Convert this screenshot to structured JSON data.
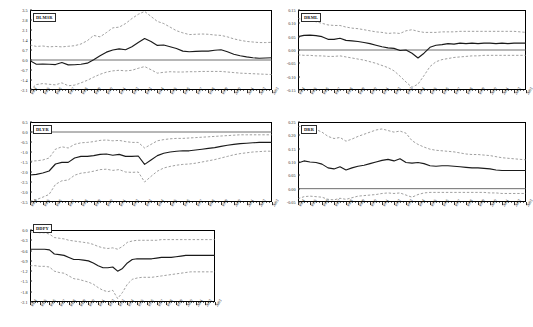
{
  "figure": {
    "type": "multi-panel-line-chart",
    "panel_count": 5
  },
  "axis": {
    "x_labels": [
      "1984",
      "1985",
      "1986",
      "1987",
      "1988",
      "1989",
      "1990",
      "1991",
      "1992",
      "1993",
      "1994",
      "1995",
      "1996",
      "1997",
      "1998",
      "1999",
      "2000",
      "2001",
      "2002",
      "2003"
    ],
    "x_min": 1984,
    "x_max": 2003
  },
  "colors": {
    "estimate": "#1a1a1a",
    "band": "#777777",
    "frame": "#000000",
    "zero": "#4a4a4a",
    "background": "#ffffff"
  },
  "chart_data": [
    {
      "id": "dlm3r",
      "type": "line",
      "title": "DLM3R",
      "xlabel": "",
      "ylabel": "",
      "grid": false,
      "legend": "none",
      "ylim": [
        -2.1,
        3.5
      ],
      "yticks": [
        "3.5",
        "2.8",
        "2.1",
        "1.4",
        "0.7",
        "0.0",
        "-0.7",
        "-1.4",
        "-2.1"
      ],
      "ytick_values": [
        3.5,
        2.8,
        2.1,
        1.4,
        0.7,
        0.0,
        -0.7,
        -1.4,
        -2.1
      ],
      "x": [
        1984,
        1984.5,
        1985,
        1985.5,
        1986,
        1986.5,
        1987,
        1987.5,
        1988,
        1988.5,
        1989,
        1989.5,
        1990,
        1990.5,
        1991,
        1991.5,
        1992,
        1992.5,
        1993,
        1993.5,
        1994,
        1994.5,
        1995,
        1995.5,
        1996,
        1996.5,
        1997,
        1997.5,
        1998,
        1998.5,
        1999,
        1999.5,
        2000,
        2000.5,
        2001,
        2001.5,
        2002,
        2002.5,
        2003
      ],
      "series": [
        {
          "name": "estimate",
          "style": "solid",
          "values": [
            -0.05,
            -0.3,
            -0.28,
            -0.3,
            -0.32,
            -0.18,
            -0.34,
            -0.33,
            -0.3,
            -0.22,
            0.02,
            0.3,
            0.55,
            0.7,
            0.78,
            0.72,
            0.93,
            1.22,
            1.5,
            1.3,
            1.02,
            1.05,
            0.93,
            0.8,
            0.62,
            0.58,
            0.6,
            0.62,
            0.62,
            0.68,
            0.72,
            0.58,
            0.4,
            0.3,
            0.22,
            0.16,
            0.12,
            0.14,
            0.16
          ]
        },
        {
          "name": "upper_band",
          "style": "dashed",
          "values": [
            1.05,
            0.95,
            0.98,
            0.92,
            0.95,
            0.92,
            0.96,
            1.0,
            1.12,
            1.35,
            1.72,
            1.62,
            1.92,
            2.25,
            2.3,
            2.55,
            2.9,
            3.2,
            3.4,
            3.05,
            2.7,
            2.55,
            2.3,
            2.05,
            1.9,
            1.78,
            1.8,
            1.82,
            1.8,
            1.75,
            1.72,
            1.62,
            1.48,
            1.38,
            1.3,
            1.26,
            1.22,
            1.22,
            1.24
          ]
        },
        {
          "name": "lower_band",
          "style": "dashed",
          "values": [
            -2.1,
            -1.72,
            -1.65,
            -1.7,
            -1.74,
            -1.6,
            -1.8,
            -1.76,
            -1.6,
            -1.42,
            -1.2,
            -1.0,
            -0.85,
            -0.76,
            -0.72,
            -0.76,
            -0.72,
            -0.58,
            -0.46,
            -0.68,
            -0.92,
            -0.86,
            -0.82,
            -0.84,
            -0.84,
            -0.82,
            -0.82,
            -0.8,
            -0.8,
            -0.8,
            -0.8,
            -0.84,
            -0.88,
            -0.92,
            -0.94,
            -0.96,
            -0.98,
            -1.0,
            -1.02
          ]
        }
      ]
    },
    {
      "id": "drml",
      "type": "line",
      "title": "DRML",
      "xlabel": "",
      "ylabel": "",
      "grid": false,
      "legend": "none",
      "ylim": [
        -0.15,
        0.15
      ],
      "yticks": [
        "0.15",
        "0.10",
        "0.05",
        "0.00",
        "-0.05",
        "-0.10",
        "-0.15"
      ],
      "ytick_values": [
        0.15,
        0.1,
        0.05,
        0.0,
        -0.05,
        -0.1,
        -0.15
      ],
      "x": [
        1984,
        1984.5,
        1985,
        1985.5,
        1986,
        1986.5,
        1987,
        1987.5,
        1988,
        1988.5,
        1989,
        1989.5,
        1990,
        1990.5,
        1991,
        1991.5,
        1992,
        1992.5,
        1993,
        1993.5,
        1994,
        1994.5,
        1995,
        1995.5,
        1996,
        1996.5,
        1997,
        1997.5,
        1998,
        1998.5,
        1999,
        1999.5,
        2000,
        2000.5,
        2001,
        2001.5,
        2002,
        2002.5,
        2003
      ],
      "series": [
        {
          "name": "estimate",
          "style": "solid",
          "values": [
            0.05,
            0.055,
            0.056,
            0.054,
            0.05,
            0.04,
            0.04,
            0.044,
            0.036,
            0.034,
            0.032,
            0.028,
            0.024,
            0.018,
            0.012,
            0.008,
            0.006,
            -0.002,
            0.0,
            -0.012,
            -0.03,
            -0.012,
            0.01,
            0.018,
            0.02,
            0.024,
            0.022,
            0.026,
            0.024,
            0.026,
            0.024,
            0.026,
            0.026,
            0.024,
            0.026,
            0.024,
            0.026,
            0.026,
            0.026
          ]
        },
        {
          "name": "upper_band",
          "style": "dashed",
          "values": [
            0.118,
            0.114,
            0.11,
            0.106,
            0.1,
            0.094,
            0.092,
            0.092,
            0.086,
            0.082,
            0.08,
            0.076,
            0.072,
            0.068,
            0.066,
            0.062,
            0.064,
            0.062,
            0.072,
            0.076,
            0.07,
            0.066,
            0.066,
            0.066,
            0.068,
            0.068,
            0.068,
            0.07,
            0.07,
            0.07,
            0.07,
            0.07,
            0.07,
            0.07,
            0.07,
            0.07,
            0.07,
            0.068,
            0.066
          ]
        },
        {
          "name": "lower_band",
          "style": "dashed",
          "values": [
            -0.018,
            -0.02,
            -0.02,
            -0.022,
            -0.022,
            -0.024,
            -0.024,
            -0.022,
            -0.026,
            -0.03,
            -0.034,
            -0.038,
            -0.044,
            -0.05,
            -0.058,
            -0.066,
            -0.078,
            -0.098,
            -0.12,
            -0.14,
            -0.128,
            -0.096,
            -0.062,
            -0.044,
            -0.036,
            -0.032,
            -0.028,
            -0.026,
            -0.024,
            -0.022,
            -0.022,
            -0.02,
            -0.02,
            -0.02,
            -0.02,
            -0.02,
            -0.02,
            -0.02,
            -0.02
          ]
        }
      ]
    },
    {
      "id": "dlyr",
      "type": "line",
      "title": "DLYR",
      "xlabel": "",
      "ylabel": "",
      "grid": false,
      "legend": "none",
      "ylim": [
        -3.5,
        0.5
      ],
      "yticks": [
        "0.5",
        "0.0",
        "-0.5",
        "-1.0",
        "-1.5",
        "-2.0",
        "-2.5",
        "-3.0",
        "-3.5"
      ],
      "ytick_values": [
        0.5,
        0.0,
        -0.5,
        -1.0,
        -1.5,
        -2.0,
        -2.5,
        -3.0,
        -3.5
      ],
      "x": [
        1984,
        1984.5,
        1985,
        1985.5,
        1986,
        1986.5,
        1987,
        1987.5,
        1988,
        1988.5,
        1989,
        1989.5,
        1990,
        1990.5,
        1991,
        1991.5,
        1992,
        1992.5,
        1993,
        1993.5,
        1994,
        1994.5,
        1995,
        1995.5,
        1996,
        1996.5,
        1997,
        1997.5,
        1998,
        1998.5,
        1999,
        1999.5,
        2000,
        2000.5,
        2001,
        2001.5,
        2002,
        2002.5,
        2003
      ],
      "series": [
        {
          "name": "estimate",
          "style": "solid",
          "values": [
            -2.15,
            -2.12,
            -2.05,
            -1.95,
            -1.6,
            -1.52,
            -1.52,
            -1.3,
            -1.22,
            -1.22,
            -1.18,
            -1.12,
            -1.1,
            -1.16,
            -1.12,
            -1.22,
            -1.22,
            -1.2,
            -1.62,
            -1.4,
            -1.18,
            -1.06,
            -1.0,
            -0.96,
            -0.94,
            -0.94,
            -0.9,
            -0.86,
            -0.82,
            -0.78,
            -0.72,
            -0.66,
            -0.62,
            -0.58,
            -0.56,
            -0.54,
            -0.52,
            -0.52,
            -0.52
          ]
        },
        {
          "name": "upper_band",
          "style": "dashed",
          "values": [
            -1.46,
            -1.44,
            -1.4,
            -1.3,
            -0.86,
            -0.74,
            -0.8,
            -0.62,
            -0.54,
            -0.52,
            -0.48,
            -0.42,
            -0.4,
            -0.44,
            -0.42,
            -0.48,
            -0.52,
            -0.52,
            -0.8,
            -0.62,
            -0.44,
            -0.38,
            -0.34,
            -0.32,
            -0.32,
            -0.3,
            -0.28,
            -0.26,
            -0.24,
            -0.22,
            -0.2,
            -0.18,
            -0.16,
            -0.14,
            -0.14,
            -0.14,
            -0.14,
            -0.14,
            -0.14
          ]
        },
        {
          "name": "lower_band",
          "style": "dashed",
          "values": [
            -3.46,
            -3.38,
            -3.26,
            -3.12,
            -2.62,
            -2.44,
            -2.4,
            -2.16,
            -2.06,
            -2.02,
            -1.96,
            -1.88,
            -1.86,
            -1.92,
            -1.88,
            -2.0,
            -2.02,
            -2.0,
            -2.5,
            -2.22,
            -1.96,
            -1.8,
            -1.72,
            -1.66,
            -1.62,
            -1.6,
            -1.56,
            -1.5,
            -1.44,
            -1.38,
            -1.3,
            -1.22,
            -1.14,
            -1.08,
            -1.04,
            -1.0,
            -0.98,
            -0.96,
            -0.96
          ]
        }
      ]
    },
    {
      "id": "drr",
      "type": "line",
      "title": "DRR",
      "xlabel": "",
      "ylabel": "",
      "grid": false,
      "legend": "none",
      "ylim": [
        -0.05,
        0.25
      ],
      "yticks": [
        "0.25",
        "0.20",
        "0.15",
        "0.10",
        "0.05",
        "0.00",
        "-0.05"
      ],
      "ytick_values": [
        0.25,
        0.2,
        0.15,
        0.1,
        0.05,
        0.0,
        -0.05
      ],
      "x": [
        1984,
        1984.5,
        1985,
        1985.5,
        1986,
        1986.5,
        1987,
        1987.5,
        1988,
        1988.5,
        1989,
        1989.5,
        1990,
        1990.5,
        1991,
        1991.5,
        1992,
        1992.5,
        1993,
        1993.5,
        1994,
        1994.5,
        1995,
        1995.5,
        1996,
        1996.5,
        1997,
        1997.5,
        1998,
        1998.5,
        1999,
        1999.5,
        2000,
        2000.5,
        2001,
        2001.5,
        2002,
        2002.5,
        2003
      ],
      "series": [
        {
          "name": "estimate",
          "style": "solid",
          "values": [
            0.096,
            0.104,
            0.1,
            0.098,
            0.092,
            0.078,
            0.074,
            0.082,
            0.07,
            0.078,
            0.084,
            0.088,
            0.094,
            0.1,
            0.106,
            0.11,
            0.104,
            0.112,
            0.098,
            0.096,
            0.098,
            0.094,
            0.086,
            0.084,
            0.086,
            0.086,
            0.084,
            0.082,
            0.08,
            0.078,
            0.078,
            0.076,
            0.074,
            0.07,
            0.068,
            0.068,
            0.068,
            0.068,
            0.068
          ]
        },
        {
          "name": "upper_band",
          "style": "dashed",
          "values": [
            0.232,
            0.236,
            0.23,
            0.222,
            0.212,
            0.196,
            0.188,
            0.192,
            0.178,
            0.186,
            0.196,
            0.204,
            0.212,
            0.22,
            0.224,
            0.218,
            0.212,
            0.216,
            0.208,
            0.18,
            0.166,
            0.156,
            0.148,
            0.144,
            0.142,
            0.14,
            0.138,
            0.134,
            0.13,
            0.128,
            0.128,
            0.126,
            0.124,
            0.12,
            0.116,
            0.114,
            0.112,
            0.11,
            0.108
          ]
        },
        {
          "name": "lower_band",
          "style": "dashed",
          "values": [
            -0.038,
            -0.03,
            -0.028,
            -0.03,
            -0.032,
            -0.04,
            -0.042,
            -0.036,
            -0.04,
            -0.034,
            -0.028,
            -0.026,
            -0.024,
            -0.022,
            -0.018,
            -0.016,
            -0.018,
            -0.016,
            -0.024,
            -0.032,
            -0.022,
            -0.016,
            -0.014,
            -0.014,
            -0.014,
            -0.014,
            -0.014,
            -0.014,
            -0.014,
            -0.014,
            -0.014,
            -0.014,
            -0.016,
            -0.016,
            -0.018,
            -0.018,
            -0.018,
            -0.018,
            -0.018
          ]
        }
      ]
    },
    {
      "id": "ddpy",
      "type": "line",
      "title": "DDPY",
      "xlabel": "",
      "ylabel": "",
      "grid": false,
      "legend": "none",
      "ylim": [
        -2.1,
        0.0
      ],
      "yticks": [
        "0.0",
        "-0.3",
        "-0.6",
        "-0.9",
        "-1.2",
        "-1.5",
        "-1.8",
        "-2.1"
      ],
      "ytick_values": [
        0.0,
        -0.3,
        -0.6,
        -0.9,
        -1.2,
        -1.5,
        -1.8,
        -2.1
      ],
      "x": [
        1984,
        1984.5,
        1985,
        1985.5,
        1986,
        1986.5,
        1987,
        1987.5,
        1988,
        1988.5,
        1989,
        1989.5,
        1990,
        1990.5,
        1991,
        1991.5,
        1992,
        1992.5,
        1993,
        1993.5,
        1994,
        1994.5,
        1995,
        1995.5,
        1996,
        1996.5,
        1997,
        1997.5,
        1998,
        1998.5,
        1999,
        1999.5,
        2000,
        2000.5,
        2001,
        2001.5,
        2002,
        2002.5,
        2003
      ],
      "series": [
        {
          "name": "estimate",
          "style": "solid",
          "values": [
            -0.56,
            -0.56,
            -0.56,
            -0.56,
            -0.58,
            -0.7,
            -0.72,
            -0.74,
            -0.8,
            -0.86,
            -0.86,
            -0.88,
            -0.9,
            -0.96,
            -1.04,
            -1.1,
            -1.1,
            -1.08,
            -1.2,
            -1.12,
            -0.96,
            -0.86,
            -0.84,
            -0.84,
            -0.84,
            -0.84,
            -0.82,
            -0.8,
            -0.8,
            -0.8,
            -0.78,
            -0.76,
            -0.74,
            -0.74,
            -0.74,
            -0.74,
            -0.74,
            -0.74,
            -0.74
          ]
        },
        {
          "name": "upper_band",
          "style": "dashed",
          "values": [
            -0.06,
            -0.06,
            -0.08,
            -0.08,
            -0.12,
            -0.22,
            -0.24,
            -0.26,
            -0.3,
            -0.32,
            -0.34,
            -0.36,
            -0.38,
            -0.42,
            -0.48,
            -0.52,
            -0.54,
            -0.52,
            -0.56,
            -0.48,
            -0.36,
            -0.32,
            -0.3,
            -0.3,
            -0.3,
            -0.3,
            -0.3,
            -0.28,
            -0.28,
            -0.28,
            -0.28,
            -0.28,
            -0.28,
            -0.28,
            -0.28,
            -0.28,
            -0.28,
            -0.28,
            -0.28
          ]
        },
        {
          "name": "lower_band",
          "style": "dashed",
          "values": [
            -1.04,
            -1.04,
            -1.06,
            -1.06,
            -1.08,
            -1.2,
            -1.24,
            -1.26,
            -1.34,
            -1.42,
            -1.44,
            -1.48,
            -1.52,
            -1.58,
            -1.68,
            -1.76,
            -1.8,
            -1.76,
            -2.0,
            -1.82,
            -1.58,
            -1.44,
            -1.4,
            -1.38,
            -1.38,
            -1.38,
            -1.36,
            -1.34,
            -1.32,
            -1.3,
            -1.28,
            -1.26,
            -1.24,
            -1.22,
            -1.22,
            -1.22,
            -1.22,
            -1.22,
            -1.22
          ]
        }
      ]
    }
  ]
}
